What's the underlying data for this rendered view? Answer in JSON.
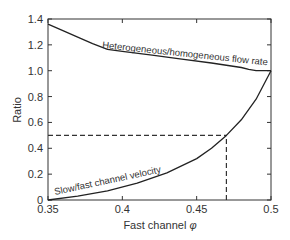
{
  "chart_data": {
    "type": "line",
    "title": "",
    "xlabel": "Fast channel φ",
    "ylabel": "Ratio",
    "xlim": [
      0.35,
      0.5
    ],
    "ylim": [
      0,
      1.4
    ],
    "x_ticks": [
      "0.35",
      "0.4",
      "0.45",
      "0.5"
    ],
    "y_ticks": [
      "0",
      "0.2",
      "0.4",
      "0.6",
      "0.8",
      "1.0",
      "1.2",
      "1.4"
    ],
    "grid": false,
    "series": [
      {
        "name": "Heterogeneous/homogeneous flow rate",
        "x": [
          0.35,
          0.36,
          0.37,
          0.38,
          0.39,
          0.4,
          0.42,
          0.44,
          0.46,
          0.48,
          0.485,
          0.49,
          0.5
        ],
        "y": [
          1.36,
          1.31,
          1.26,
          1.21,
          1.165,
          1.15,
          1.12,
          1.09,
          1.06,
          1.025,
          1.01,
          1.0,
          1.0
        ]
      },
      {
        "name": "Slow/fast channel velocity",
        "x": [
          0.35,
          0.37,
          0.39,
          0.41,
          0.43,
          0.45,
          0.46,
          0.47,
          0.48,
          0.49,
          0.5
        ],
        "y": [
          0.0,
          0.03,
          0.07,
          0.13,
          0.21,
          0.32,
          0.4,
          0.5,
          0.62,
          0.78,
          1.0
        ]
      }
    ],
    "reference_lines": [
      {
        "type": "horizontal",
        "y": 0.5,
        "x_range": [
          0.35,
          0.47
        ],
        "style": "dashed"
      },
      {
        "type": "vertical",
        "x": 0.47,
        "y_range": [
          0,
          0.5
        ],
        "style": "dashed"
      }
    ],
    "annotations": [
      {
        "text": "Heterogeneous/homogeneous flow rate"
      },
      {
        "text": "Slow/fast channel velocity"
      }
    ]
  }
}
